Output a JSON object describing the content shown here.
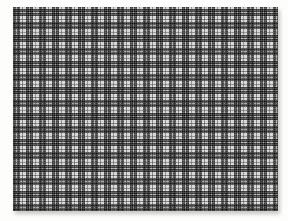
{
  "photo": {
    "description": "Photograph of a rectangular woven fabric swatch with a black-and-white plaid (shepherd's check / tartan) pattern, lying on a plain white background with a soft shadow along its bottom and right edges",
    "background": "plain white surface",
    "swatch": {
      "label": "black-and-white plaid fabric swatch",
      "left_px": 13,
      "top_px": 7,
      "width_px": 265,
      "height_px": 204
    },
    "pattern": {
      "type": "plaid / shepherd's check",
      "repeat_px": 13,
      "stripe_sequence_px": [
        3,
        1,
        3,
        2,
        1,
        3
      ],
      "stripe_roles": [
        "dark band",
        "light tick",
        "dark band",
        "white ground",
        "gray pinstripe",
        "white ground"
      ],
      "weave": "warp and weft stripes cross; intersections of dark bands appear near-solid black, dark-over-white appears dark gray, white-over-white appears off-white with fine gray pinstripes"
    }
  },
  "palette": {
    "bg": "#fdfdfc",
    "ink": "#474747",
    "tick": "#bdbdbd",
    "paper": "#efefef",
    "pin": "#8f8f8f",
    "crossing-black": "#151515",
    "shadow": "rgba(0,0,0,0.22)"
  }
}
